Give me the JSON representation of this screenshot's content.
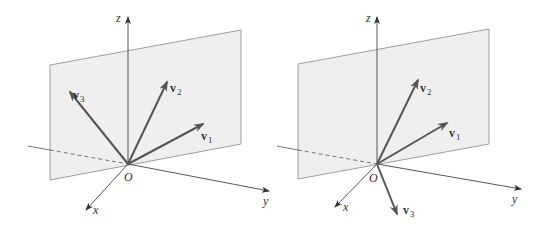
{
  "figures": [
    {
      "id": "left",
      "description": "Three vectors v1, v2, v3 all lying in a plane through the origin",
      "axes": {
        "x": "x",
        "y": "y",
        "z": "z"
      },
      "origin_label": "O",
      "vectors": [
        {
          "name": "v",
          "sub": "1"
        },
        {
          "name": "v",
          "sub": "2"
        },
        {
          "name": "v",
          "sub": "3"
        }
      ]
    },
    {
      "id": "right",
      "description": "Vectors v1 and v2 in a plane, v3 pointing out of the plane",
      "axes": {
        "x": "x",
        "y": "y",
        "z": "z"
      },
      "origin_label": "O",
      "vectors": [
        {
          "name": "v",
          "sub": "1"
        },
        {
          "name": "v",
          "sub": "2"
        },
        {
          "name": "v",
          "sub": "3"
        }
      ]
    }
  ],
  "colors": {
    "plane_fill": "#efefef",
    "plane_stroke": "#888888",
    "vector": "#555555",
    "axis": "#444444"
  }
}
